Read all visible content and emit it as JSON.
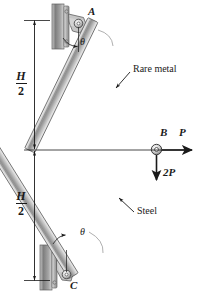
{
  "figure": {
    "name": "two-bar-pin-truss-diagram",
    "type": "engineering-free-body-diagram",
    "width": 198,
    "height": 293,
    "background_color": "#ffffff",
    "line_color": "#1a1a1a"
  },
  "points": {
    "A": {
      "label": "A",
      "x": 93,
      "y": 14,
      "description": "upper pin support at wall"
    },
    "B": {
      "label": "B",
      "x": 157,
      "y": 150,
      "description": "center pin joint where bars meet and loads apply"
    },
    "C": {
      "label": "C",
      "x": 73,
      "y": 281,
      "description": "lower pin support at wall"
    }
  },
  "members": [
    {
      "name": "upper-bar",
      "label": "Rare metal",
      "from": "A",
      "to": "B",
      "material": "Rare metal",
      "fill_light": "#e8e8e8",
      "fill_dark": "#8a8a8a"
    },
    {
      "name": "lower-bar",
      "label": "Steel",
      "from": "C",
      "to": "B",
      "material": "Steel",
      "fill_light": "#e8e8e8",
      "fill_dark": "#8a8a8a"
    }
  ],
  "labels": {
    "rare_metal": "Rare metal",
    "steel": "Steel",
    "theta_upper": "θ",
    "theta_lower": "θ",
    "point_a": "A",
    "point_b": "B",
    "point_c": "C"
  },
  "forces": [
    {
      "name": "horizontal-force-P",
      "label": "P",
      "magnitude": "P",
      "direction": "right",
      "applied_at": "B"
    },
    {
      "name": "vertical-force-2P",
      "label": "2P",
      "magnitude": "2P",
      "direction": "down",
      "applied_at": "B"
    }
  ],
  "dimensions": [
    {
      "name": "upper-height-dimension",
      "numerator": "H",
      "denominator": "2",
      "text": "H/2",
      "from_y": 20,
      "to_y": 148,
      "side": "left"
    },
    {
      "name": "lower-height-dimension",
      "numerator": "H",
      "denominator": "2",
      "text": "H/2",
      "from_y": 152,
      "to_y": 280,
      "side": "left"
    }
  ],
  "supports": [
    {
      "name": "upper-wall-support",
      "type": "pinned-wall-bracket",
      "at": "A",
      "hatch_color": "#9a9a9a"
    },
    {
      "name": "lower-wall-support",
      "type": "pinned-wall-bracket",
      "at": "C",
      "hatch_color": "#9a9a9a"
    }
  ],
  "angles": [
    {
      "name": "theta-at-A",
      "symbol": "θ",
      "between": "vertical wall line and upper bar AB"
    },
    {
      "name": "theta-at-C",
      "symbol": "θ",
      "between": "vertical wall line and lower bar CB"
    }
  ]
}
